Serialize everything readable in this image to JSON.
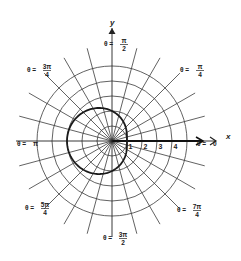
{
  "figure": {
    "center": {
      "x": 112,
      "y": 141
    },
    "unit_px": 15,
    "grid": {
      "circle_radii_units": [
        1,
        2,
        3,
        4,
        5
      ],
      "spoke_step_deg": 15,
      "spoke_length_px": 96,
      "line_color": "#3a3a3a"
    },
    "curve": {
      "equation": "r = 2 - cos(θ)",
      "a": 2,
      "b": -1,
      "color": "#1a1a1a"
    },
    "axes": {
      "x_label": "x",
      "y_label": "y",
      "x_arrow_end": 203,
      "x_second_arrow": 216,
      "y_arrow_end": 28
    },
    "tick_labels": [
      {
        "text": "1",
        "value": 1
      },
      {
        "text": "2",
        "value": 2
      },
      {
        "text": "3",
        "value": 3
      },
      {
        "text": "4",
        "value": 4
      }
    ],
    "angle_labels": [
      {
        "id": "theta-0",
        "prefix": "θ = ",
        "num": "0",
        "den": "",
        "x": 197,
        "y": 146
      },
      {
        "id": "theta-pi-4",
        "prefix": "θ = ",
        "num": "π",
        "den": "4",
        "x": 180,
        "y": 72
      },
      {
        "id": "theta-pi-2",
        "prefix": "θ = ",
        "num": "π",
        "den": "2",
        "x": 104,
        "y": 46
      },
      {
        "id": "theta-3pi-4",
        "prefix": "θ = ",
        "num": "3π",
        "den": "4",
        "x": 27,
        "y": 72
      },
      {
        "id": "theta-pi",
        "prefix": "θ = ",
        "num": "π",
        "den": "",
        "x": 17,
        "y": 146
      },
      {
        "id": "theta-5pi-4",
        "prefix": "θ = ",
        "num": "5π",
        "den": "4",
        "x": 25,
        "y": 210
      },
      {
        "id": "theta-3pi-2",
        "prefix": "θ = ",
        "num": "3π",
        "den": "2",
        "x": 103,
        "y": 240
      },
      {
        "id": "theta-7pi-4",
        "prefix": "θ = ",
        "num": "7π",
        "den": "4",
        "x": 177,
        "y": 212
      }
    ]
  }
}
